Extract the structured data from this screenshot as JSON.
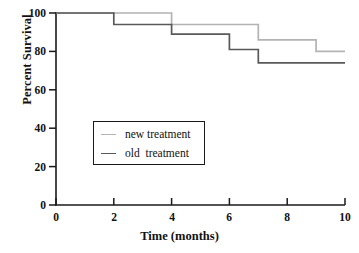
{
  "chart_data": {
    "type": "line",
    "subtype": "kaplan-meier-step",
    "title": "",
    "xlabel": "Time (months)",
    "ylabel": "Percent Survival",
    "xlim": [
      0,
      10
    ],
    "ylim": [
      0,
      100
    ],
    "xticks": [
      0,
      2,
      4,
      6,
      8,
      10
    ],
    "yticks": [
      0,
      20,
      40,
      60,
      80,
      100
    ],
    "xtick_labels": [
      "0",
      "2",
      "4",
      "6",
      "8",
      "10"
    ],
    "ytick_labels": [
      "0",
      "20",
      "40",
      "60",
      "80",
      "100"
    ],
    "grid": false,
    "legend_position": "center-left",
    "step_mode": "post",
    "series": [
      {
        "name": "new treatment",
        "color": "#b3b3b3",
        "x": [
          0,
          4,
          4,
          7,
          7,
          9,
          9,
          10
        ],
        "y": [
          100,
          100,
          94,
          94,
          86,
          86,
          80,
          80
        ],
        "steps": [
          {
            "time": 0,
            "survival": 100
          },
          {
            "time": 4,
            "survival": 94
          },
          {
            "time": 7,
            "survival": 86
          },
          {
            "time": 9,
            "survival": 80
          }
        ]
      },
      {
        "name": "old  treatment",
        "color": "#595959",
        "x": [
          0,
          2,
          2,
          4,
          4,
          6,
          6,
          7,
          7,
          10
        ],
        "y": [
          100,
          100,
          94,
          94,
          89,
          89,
          81,
          81,
          74,
          74
        ],
        "steps": [
          {
            "time": 0,
            "survival": 100
          },
          {
            "time": 2,
            "survival": 94
          },
          {
            "time": 4,
            "survival": 89
          },
          {
            "time": 6,
            "survival": 81
          },
          {
            "time": 7,
            "survival": 74
          }
        ]
      }
    ],
    "legend_entries": [
      {
        "label": "new treatment",
        "color": "#b3b3b3"
      },
      {
        "label": "old  treatment",
        "color": "#595959"
      }
    ]
  },
  "axes": {
    "x_label": "Time (months)",
    "y_label": "Percent Survival",
    "x_tick_labels": [
      "0",
      "2",
      "4",
      "6",
      "8",
      "10"
    ],
    "y_tick_labels": [
      "0",
      "20",
      "40",
      "60",
      "80",
      "100"
    ],
    "axis_color": "#1a1a1a"
  },
  "legend": {
    "items": [
      {
        "label": "new treatment",
        "color": "#b3b3b3"
      },
      {
        "label": "old  treatment",
        "color": "#595959"
      }
    ]
  }
}
